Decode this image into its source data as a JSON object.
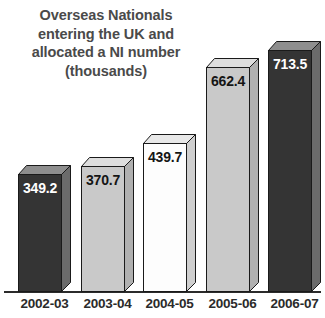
{
  "chart_data": {
    "type": "bar",
    "title": "Overseas Nationals entering the UK and allocated a NI number (thousands)",
    "title_lines": [
      "Overseas Nationals",
      "entering the UK and",
      "allocated a NI number",
      "(thousands)"
    ],
    "categories": [
      "2002-03",
      "2003-04",
      "2004-05",
      "2005-06",
      "2006-07"
    ],
    "values": [
      349.2,
      370.7,
      439.7,
      662.4,
      713.5
    ],
    "value_labels": [
      "349.2",
      "370.7",
      "439.7",
      "662.4",
      "713.5"
    ],
    "xlabel": "",
    "ylabel": "thousands",
    "ylim": [
      0,
      780
    ],
    "grid": false,
    "legend": false,
    "bar_colors": [
      "#343434",
      "#c9c9c9",
      "#fdfdfd",
      "#c9c9c9",
      "#343434"
    ],
    "bar_top_colors": [
      "#8e8e8e",
      "#dedede",
      "#e8e8e8",
      "#dedede",
      "#8e8e8e"
    ],
    "bar_side_colors": [
      "#6b6b6b",
      "#b0b0b0",
      "#cfcfcf",
      "#b0b0b0",
      "#6b6b6b"
    ],
    "label_text_colors": [
      "#ffffff",
      "#151515",
      "#151515",
      "#151515",
      "#ffffff"
    ],
    "style": "3d-bar",
    "outline_color": "#1a1a1a",
    "axis_color": "#2b2b2b",
    "title_color": "#4a4a4a",
    "background": "#ffffff"
  }
}
